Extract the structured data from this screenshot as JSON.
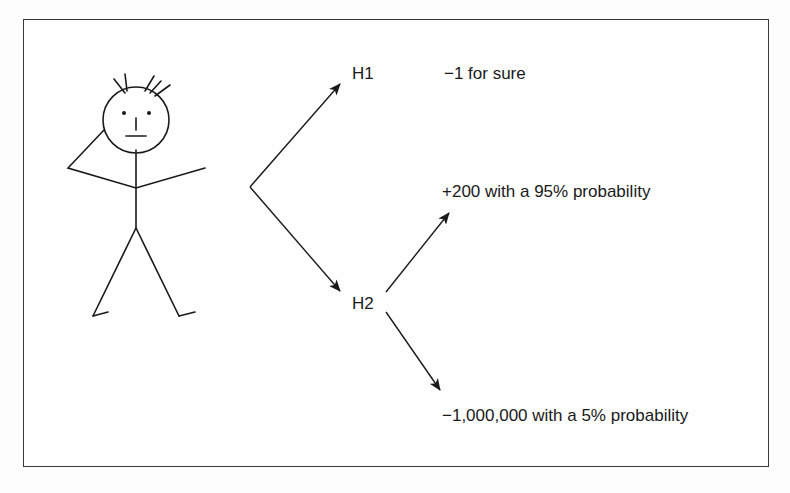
{
  "diagram": {
    "type": "decision-tree",
    "actor": "stick-figure",
    "nodes": {
      "h1": "H1",
      "h2": "H2"
    },
    "outcomes": {
      "h1": "−1 for sure",
      "h2_good": "+200 with a 95% probability",
      "h2_bad": "−1,000,000 with a 5% probability"
    },
    "colors": {
      "line": "#1a1a1a",
      "border": "#3a3a3a",
      "background": "#fefefe"
    }
  }
}
